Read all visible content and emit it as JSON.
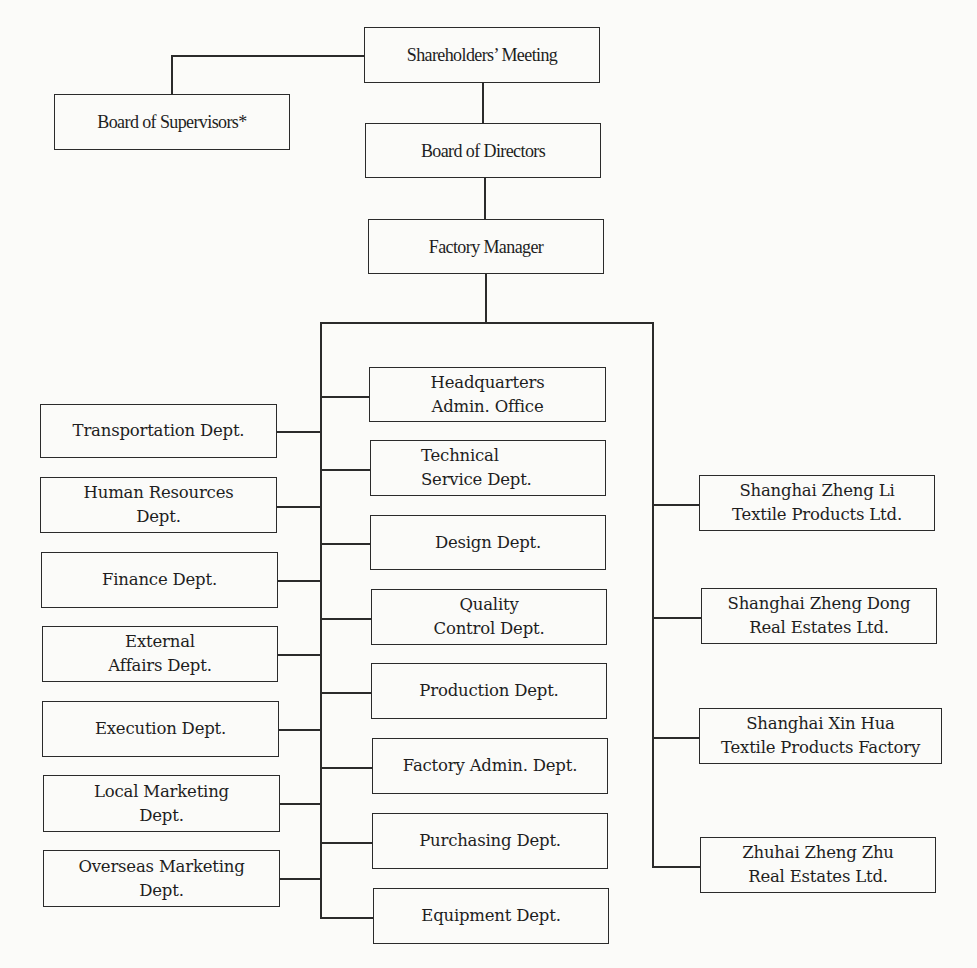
{
  "chart": {
    "title": "",
    "top": {
      "shareholders": "Shareholders’ Meeting",
      "supervisors": "Board of Supervisors*",
      "directors": "Board of Directors",
      "factory_manager": "Factory Manager"
    },
    "left_departments": [
      "Transportation Dept.",
      "Human Resources\nDept.",
      "Finance Dept.",
      "External\nAffairs Dept.",
      "Execution Dept.",
      "Local Marketing\nDept.",
      "Overseas Marketing\nDept."
    ],
    "center_departments": [
      "Headquarters\nAdmin. Office",
      "Technical\nService Dept.",
      "Design Dept.",
      "Quality\nControl Dept.",
      "Production Dept.",
      "Factory Admin. Dept.",
      "Purchasing Dept.",
      "Equipment Dept."
    ],
    "subsidiaries": [
      "Shanghai Zheng Li\nTextile Products Ltd.",
      "Shanghai Zheng Dong\nReal Estates Ltd.",
      "Shanghai Xin Hua\nTextile Products Factory",
      "Zhuhai Zheng Zhu\nReal Estates Ltd."
    ]
  },
  "colors": {
    "line": "#2b2b2b",
    "text": "#1e1e1e",
    "background": "#fbfbf9"
  }
}
